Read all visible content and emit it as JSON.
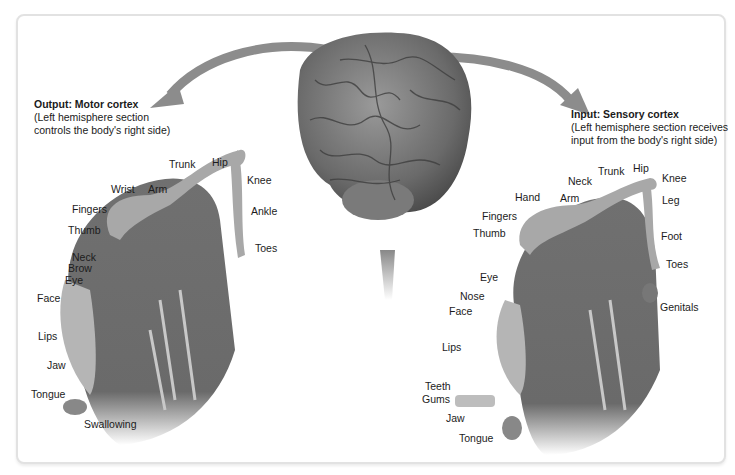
{
  "figure": {
    "motor": {
      "heading": "Output: Motor cortex",
      "desc_line1": "(Left hemisphere section",
      "desc_line2": "controls the body's right side)",
      "labels": [
        "Trunk",
        "Hip",
        "Wrist",
        "Arm",
        "Knee",
        "Fingers",
        "Ankle",
        "Thumb",
        "Toes",
        "Neck",
        "Brow",
        "Eye",
        "Face",
        "Lips",
        "Jaw",
        "Tongue",
        "Swallowing"
      ]
    },
    "sensory": {
      "heading": "Input: Sensory cortex",
      "desc_line1": "(Left hemisphere section receives",
      "desc_line2": "input from the body's right side)",
      "labels": [
        "Trunk",
        "Hip",
        "Neck",
        "Knee",
        "Hand",
        "Arm",
        "Leg",
        "Fingers",
        "Thumb",
        "Foot",
        "Toes",
        "Eye",
        "Nose",
        "Face",
        "Genitals",
        "Lips",
        "Teeth",
        "Gums",
        "Jaw",
        "Tongue"
      ]
    },
    "colors": {
      "cortex": "#6e6e6e",
      "body": "#a8a8a8",
      "arrow": "#8c8c8c",
      "frame": "#e2e2e2"
    }
  }
}
